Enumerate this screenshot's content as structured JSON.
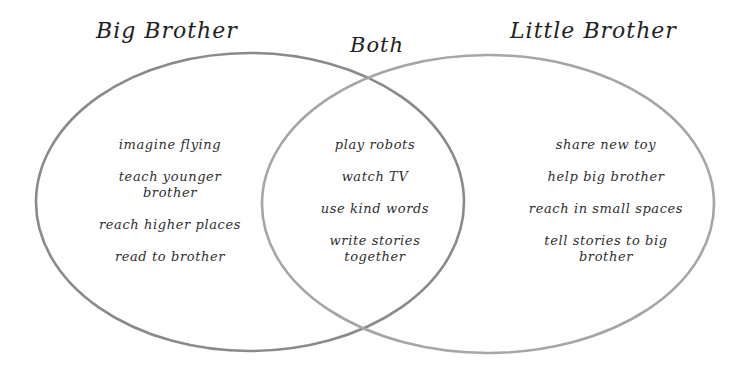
{
  "diagram": {
    "type": "venn",
    "sets": [
      {
        "id": "left",
        "title": "Big Brother",
        "items": [
          "imagine flying",
          "teach younger brother",
          "reach higher places",
          "read to brother"
        ]
      },
      {
        "id": "intersection",
        "title": "Both",
        "items": [
          "play robots",
          "watch TV",
          "use kind words",
          "write stories together"
        ]
      },
      {
        "id": "right",
        "title": "Little Brother",
        "items": [
          "share new toy",
          "help big brother",
          "reach in small spaces",
          "tell stories to big brother"
        ]
      }
    ],
    "colors": {
      "background": "#ffffff",
      "left_circle_stroke": "#8a8a8a",
      "right_circle_stroke": "#a6a6a6",
      "text": "#2e2e2e"
    }
  }
}
